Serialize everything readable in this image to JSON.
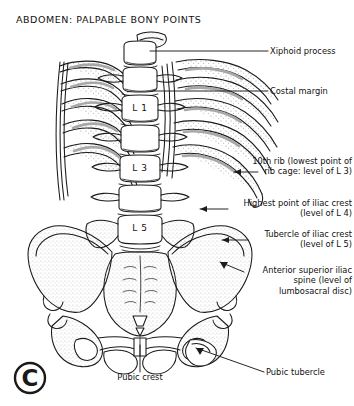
{
  "figure": {
    "title": "ABDOMEN: PALPABLE BONY POINTS",
    "copyright_symbol": "©"
  },
  "vertebrae": [
    {
      "id": "l1",
      "label": "L 1"
    },
    {
      "id": "l3",
      "label": "L 3"
    },
    {
      "id": "l5",
      "label": "L 5"
    }
  ],
  "labels": {
    "xiphoid_process": "Xiphoid process",
    "costal_margin": "Costal margin",
    "tenth_rib": "10th rib (lowest point of\nrib cage: level of L 3)",
    "highest_iliac_crest": "Highest point of iliac crest\n(level of L 4)",
    "tubercle_iliac_crest": "Tubercle of iliac crest\n(level of L 5)",
    "asis": "Anterior superior iliac\nspine (level of\nlumbosacral disc)",
    "pubic_crest": "Pubic crest",
    "pubic_tubercle": "Pubic tubercle"
  },
  "colors": {
    "ink": "#1a1a1a",
    "background": "#ffffff",
    "shade": "#9a9a9a",
    "stipple": "#8d8d8d"
  }
}
